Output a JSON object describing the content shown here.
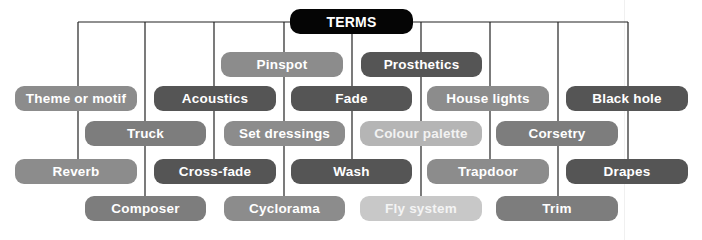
{
  "diagram": {
    "root": {
      "label": "TERMS",
      "color": "#050505"
    },
    "terms": [
      {
        "label": "Pinspot",
        "row": 1,
        "shade": "mid",
        "color": "#8c8c8c"
      },
      {
        "label": "Prosthetics",
        "row": 1,
        "shade": "dark",
        "color": "#555555"
      },
      {
        "label": "Theme or motif",
        "row": 2,
        "shade": "mid",
        "color": "#8c8c8c"
      },
      {
        "label": "Acoustics",
        "row": 2,
        "shade": "dark",
        "color": "#555555"
      },
      {
        "label": "Fade",
        "row": 2,
        "shade": "dark",
        "color": "#555555"
      },
      {
        "label": "House lights",
        "row": 2,
        "shade": "mid",
        "color": "#8c8c8c"
      },
      {
        "label": "Black hole",
        "row": 2,
        "shade": "dark",
        "color": "#555555"
      },
      {
        "label": "Truck",
        "row": 3,
        "shade": "med",
        "color": "#7d7d7d"
      },
      {
        "label": "Set dressings",
        "row": 3,
        "shade": "mid",
        "color": "#8c8c8c"
      },
      {
        "label": "Colour palette",
        "row": 3,
        "shade": "light",
        "color": "#b5b5b5"
      },
      {
        "label": "Corsetry",
        "row": 3,
        "shade": "med",
        "color": "#7d7d7d"
      },
      {
        "label": "Reverb",
        "row": 4,
        "shade": "mid",
        "color": "#8c8c8c"
      },
      {
        "label": "Cross-fade",
        "row": 4,
        "shade": "dark",
        "color": "#555555"
      },
      {
        "label": "Wash",
        "row": 4,
        "shade": "dark",
        "color": "#555555"
      },
      {
        "label": "Trapdoor",
        "row": 4,
        "shade": "mid",
        "color": "#8c8c8c"
      },
      {
        "label": "Drapes",
        "row": 4,
        "shade": "dark",
        "color": "#555555"
      },
      {
        "label": "Composer",
        "row": 5,
        "shade": "med",
        "color": "#7d7d7d"
      },
      {
        "label": "Cyclorama",
        "row": 5,
        "shade": "mid",
        "color": "#8c8c8c"
      },
      {
        "label": "Fly system",
        "row": 5,
        "shade": "pale",
        "color": "#c8c8c8"
      },
      {
        "label": "Trim",
        "row": 5,
        "shade": "med",
        "color": "#7d7d7d"
      }
    ],
    "line_color": "#222222"
  }
}
